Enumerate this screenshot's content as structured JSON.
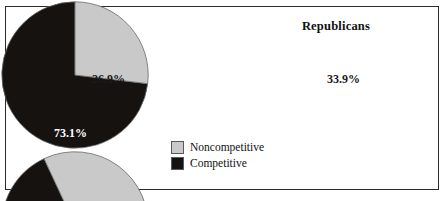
{
  "figure": {
    "background_color": "#ffffff",
    "border_color": "#2b2b2b"
  },
  "colors": {
    "noncompetitive": "#c9c9c9",
    "competitive": "#151210",
    "outline": "#6a6a6a",
    "label_dark": "#1a1a1a",
    "label_light": "#ffffff"
  },
  "legend": {
    "position": "center-bottom",
    "items": [
      {
        "label": "Noncompetitive",
        "color": "#c9c9c9",
        "swatch_name": "legend-swatch-noncompetitive"
      },
      {
        "label": "Competitive",
        "color": "#151210",
        "swatch_name": "legend-swatch-competitive"
      }
    ]
  },
  "charts": {
    "democrats": {
      "title": "Democrats",
      "labels": {
        "noncompetitive": "26.9%",
        "competitive": "73.1%"
      }
    },
    "republicans": {
      "title": "Republicans",
      "labels": {
        "noncompetitive": "33.9%",
        "competitive": "66.1%"
      }
    }
  },
  "chart_data": [
    {
      "type": "pie",
      "title": "Democrats",
      "categories": [
        "Noncompetitive",
        "Competitive"
      ],
      "values": [
        26.9,
        66.1
      ],
      "slices": [
        {
          "name": "Noncompetitive",
          "value": 26.9,
          "label": "26.9%",
          "color": "#c9c9c9",
          "start_angle_deg": 0,
          "sweep_deg": 96.8
        },
        {
          "name": "Competitive",
          "value": 73.1,
          "label": "73.1%",
          "color": "#151210",
          "start_angle_deg": 96.8,
          "sweep_deg": 263.2
        }
      ],
      "units": "percent",
      "start_angle_note": "Noncompetitive begins at 12 o'clock, sweeping clockwise",
      "legend": [
        "Noncompetitive",
        "Competitive"
      ],
      "legend_position": "center-bottom"
    },
    {
      "type": "pie",
      "title": "Republicans",
      "categories": [
        "Noncompetitive",
        "Competitive"
      ],
      "values": [
        33.9,
        66.1
      ],
      "slices": [
        {
          "name": "Noncompetitive",
          "value": 33.9,
          "label": "33.9%",
          "color": "#c9c9c9",
          "start_angle_deg": -25,
          "sweep_deg": 122.0
        },
        {
          "name": "Competitive",
          "value": 66.1,
          "label": "66.1%",
          "color": "#151210",
          "start_angle_deg": 97.0,
          "sweep_deg": 238.0
        }
      ],
      "units": "percent",
      "start_angle_note": "Noncompetitive begins near 11 o'clock, sweeping clockwise",
      "legend": [
        "Noncompetitive",
        "Competitive"
      ],
      "legend_position": "center-bottom"
    }
  ]
}
